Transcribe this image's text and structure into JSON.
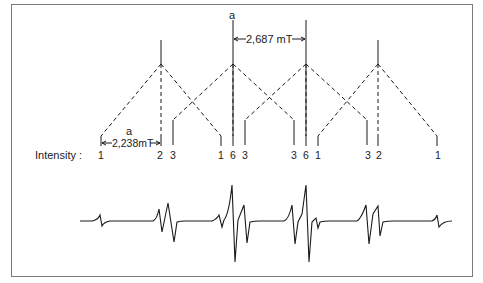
{
  "diagram": {
    "type": "epr-hyperfine-splitting-stick-diagram",
    "intensity_label": "Intensity :",
    "coupling_large": {
      "symbol": "a",
      "value_label": "2,687 mT"
    },
    "coupling_small": {
      "symbol": "a",
      "value_label": "2,238mT"
    },
    "first_level_lines": [
      {
        "x": 161,
        "height": "short"
      },
      {
        "x": 233,
        "height": "tall"
      },
      {
        "x": 306,
        "height": "tall"
      },
      {
        "x": 378,
        "height": "short"
      }
    ],
    "intensities": [
      {
        "x": 101,
        "value": "1"
      },
      {
        "x": 160,
        "value": "2"
      },
      {
        "x": 173,
        "value": "3"
      },
      {
        "x": 221,
        "value": "1"
      },
      {
        "x": 233,
        "value": "6"
      },
      {
        "x": 245,
        "value": "3"
      },
      {
        "x": 294,
        "value": "3"
      },
      {
        "x": 306,
        "value": "6"
      },
      {
        "x": 318,
        "value": "1"
      },
      {
        "x": 368,
        "value": "3"
      },
      {
        "x": 379,
        "value": "2"
      },
      {
        "x": 438,
        "value": "1"
      }
    ],
    "colors": {
      "line": "#1a1a1a",
      "frame": "#7a7a7a",
      "text": "#222222"
    }
  }
}
